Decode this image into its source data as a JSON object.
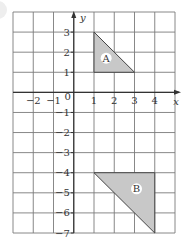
{
  "diagram": {
    "type": "coordinate-grid",
    "x_range": [
      -3,
      5
    ],
    "y_range": [
      -7,
      4
    ],
    "axis_labels": {
      "x": "x",
      "y": "y"
    },
    "origin_label": "0",
    "x_ticks": [
      {
        "value": -2,
        "label": "−2"
      },
      {
        "value": -1,
        "label": "−1"
      },
      {
        "value": 1,
        "label": "1"
      },
      {
        "value": 2,
        "label": "2"
      },
      {
        "value": 3,
        "label": "3"
      },
      {
        "value": 4,
        "label": "4"
      }
    ],
    "y_ticks": [
      {
        "value": 3,
        "label": "3"
      },
      {
        "value": 2,
        "label": "2"
      },
      {
        "value": 1,
        "label": "1"
      },
      {
        "value": -1,
        "label": "−1"
      },
      {
        "value": -2,
        "label": "−2"
      },
      {
        "value": -3,
        "label": "−3"
      },
      {
        "value": -4,
        "label": "−4"
      },
      {
        "value": -5,
        "label": "−5"
      },
      {
        "value": -6,
        "label": "−6"
      },
      {
        "value": -7,
        "label": "−7"
      }
    ],
    "shapes": [
      {
        "label": "A",
        "vertices": [
          [
            1,
            3
          ],
          [
            1,
            1
          ],
          [
            3,
            1
          ]
        ],
        "fill": "#c8c8c8",
        "label_pos": [
          1.6,
          1.7
        ]
      },
      {
        "label": "B",
        "vertices": [
          [
            1,
            -4
          ],
          [
            4,
            -4
          ],
          [
            4,
            -7
          ]
        ],
        "fill": "#c8c8c8",
        "label_pos": [
          3.1,
          -4.8
        ]
      }
    ],
    "colors": {
      "grid": "#7a7a7a",
      "axis": "#333333",
      "shape_stroke": "#444444"
    }
  }
}
